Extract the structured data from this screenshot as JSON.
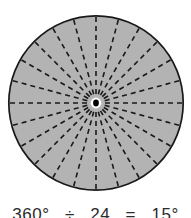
{
  "figure": {
    "background_color": "#ffffff"
  },
  "circle": {
    "fill_color": "#b3b3b3",
    "outline_color": "#1a1a1a",
    "outline_width": 1.6,
    "center_x": 96,
    "center_y": 103,
    "radius": 88,
    "center_dot_color": "#000000",
    "center_dot_radius": 3.2,
    "center_ring_color": "#ffffff",
    "center_ring_radius": 5.5
  },
  "sectors": {
    "count": 24,
    "angle_degrees": 15,
    "spoke_count": 24,
    "diameter_count": 12,
    "line_color": "#1a1a1a",
    "line_width": 1.6,
    "dash_pattern": "5,4",
    "angles_degrees": [
      0,
      15,
      30,
      45,
      60,
      75,
      90,
      105,
      120,
      135,
      150,
      165,
      180,
      195,
      210,
      225,
      240,
      255,
      270,
      285,
      300,
      315,
      330,
      345
    ]
  },
  "caption": {
    "full_text": "360° ÷ 24 = 15°",
    "total_degrees": "360°",
    "divide_symbol": "÷",
    "divisor": "24",
    "equals_symbol": "=",
    "result": "15°"
  },
  "chart_data": {
    "type": "pie",
    "title": "360° ÷ 24 = 15°",
    "categories": [
      "1",
      "2",
      "3",
      "4",
      "5",
      "6",
      "7",
      "8",
      "9",
      "10",
      "11",
      "12",
      "13",
      "14",
      "15",
      "16",
      "17",
      "18",
      "19",
      "20",
      "21",
      "22",
      "23",
      "24"
    ],
    "values": [
      15,
      15,
      15,
      15,
      15,
      15,
      15,
      15,
      15,
      15,
      15,
      15,
      15,
      15,
      15,
      15,
      15,
      15,
      15,
      15,
      15,
      15,
      15,
      15
    ],
    "unit": "degrees",
    "total": 360,
    "slice_count": 24,
    "slice_angle": 15,
    "legend": "none",
    "grid": false
  }
}
